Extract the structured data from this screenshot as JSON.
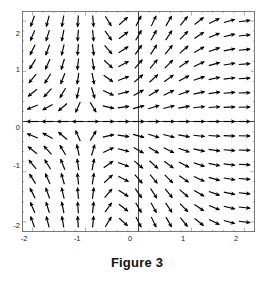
{
  "figure": {
    "caption": "Figure 3"
  },
  "chart_data": {
    "type": "scatter",
    "subtype": "vector-field",
    "title": "Figure 3",
    "xlabel": "",
    "ylabel": "",
    "xlim": [
      -2.2,
      2.2
    ],
    "ylim": [
      -2.2,
      2.2
    ],
    "grid": false,
    "legend": null,
    "axes": {
      "zero_axis_horizontal": 0,
      "zero_axis_vertical": 0,
      "frame": true,
      "minor_ticks": true
    },
    "x_ticks": [
      -2,
      -1,
      0,
      1,
      2
    ],
    "x_tick_labels": [
      "-2",
      "-1",
      "0",
      "1",
      "2"
    ],
    "y_ticks": [
      -2,
      -1,
      0,
      1,
      2
    ],
    "y_tick_labels": [
      "-2",
      "-1",
      "0",
      "1",
      "2"
    ],
    "grid_shape": [
      15,
      15
    ],
    "sample_x": [
      -2.0,
      -1.714,
      -1.429,
      -1.143,
      -0.857,
      -0.571,
      -0.286,
      0.0,
      0.286,
      0.571,
      0.857,
      1.143,
      1.429,
      1.714,
      2.0
    ],
    "sample_y": [
      -2.0,
      -1.714,
      -1.429,
      -1.143,
      -0.857,
      -0.571,
      -0.286,
      0.0,
      0.286,
      0.571,
      0.857,
      1.143,
      1.429,
      1.714,
      2.0
    ],
    "field": {
      "u_expression": "1 + x",
      "v_expression": "2 * y * (1 + x) / (1 + x*x) - y",
      "description": "Direction field of a first order ODE; arrows are unit-normalized with length scaled to grid spacing."
    },
    "colors": {
      "arrow": "#000000",
      "frame": "#555555",
      "axis": "#333333",
      "tick_label": "#1a1a1a",
      "caption": "#111111",
      "background": "#ffffff"
    }
  }
}
